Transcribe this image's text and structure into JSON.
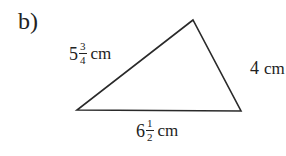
{
  "part_label": "b)",
  "triangle": {
    "vertices": {
      "top": [
        193,
        20
      ],
      "left": [
        77,
        110
      ],
      "right": [
        241,
        111
      ]
    },
    "stroke_color": "#2a2a2a"
  },
  "sides": {
    "left": {
      "whole": "5",
      "numerator": "3",
      "denominator": "4",
      "unit": "cm"
    },
    "right": {
      "value": "4",
      "unit": "cm"
    },
    "bottom": {
      "whole": "6",
      "numerator": "1",
      "denominator": "2",
      "unit": "cm"
    }
  }
}
